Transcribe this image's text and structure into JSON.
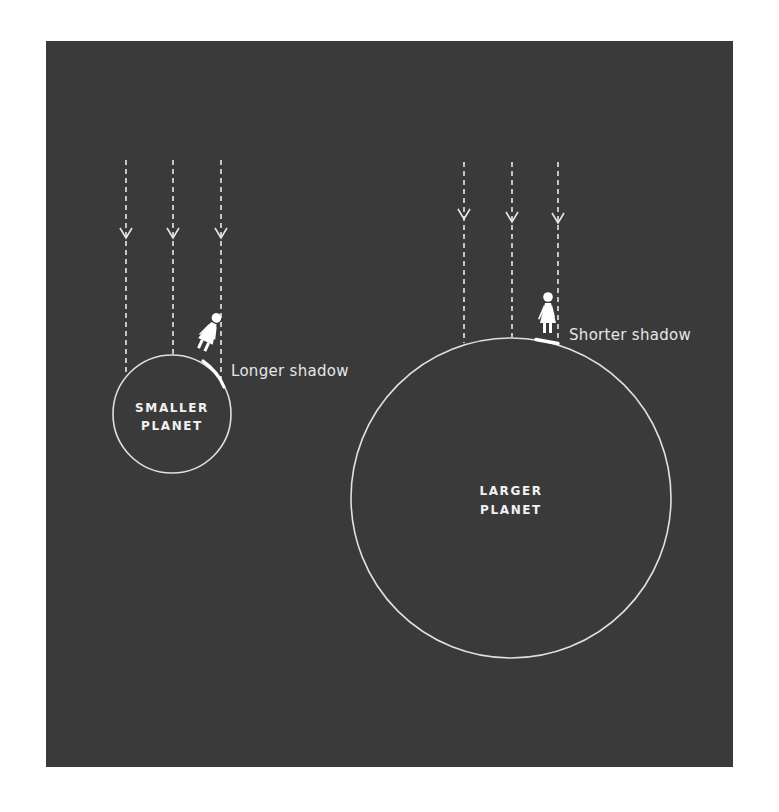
{
  "colors": {
    "background": "#3a3a3a",
    "page": "#ffffff",
    "line": "#e8e8e8",
    "figure": "#ffffff",
    "text": "#e6e6e6"
  },
  "small_planet": {
    "label_line1": "SMALLER",
    "label_line2": "PLANET",
    "shadow_label": "Longer shadow",
    "sun_rays": 3
  },
  "large_planet": {
    "label_line1": "LARGER",
    "label_line2": "PLANET",
    "shadow_label": "Shorter shadow",
    "sun_rays": 3
  },
  "icons": {
    "sun_ray": "dashed-arrow-down",
    "person": "person-figure"
  }
}
